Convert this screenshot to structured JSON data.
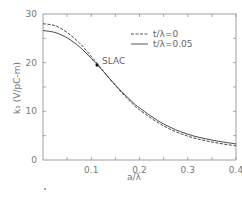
{
  "chart_data": {
    "type": "line",
    "title": "",
    "xlabel": "a/λ",
    "ylabel": "k₁ (V/pC-m)",
    "xlim": [
      0,
      0.4
    ],
    "ylim": [
      0,
      30
    ],
    "xticks": [
      0.1,
      0.2,
      0.3,
      0.4
    ],
    "xtick_labels": [
      "0.1",
      "0.2",
      "0.3",
      "0.4"
    ],
    "yticks": [
      0,
      10,
      20,
      30
    ],
    "ytick_labels": [
      "0",
      "10",
      "20",
      "30"
    ],
    "grid": false,
    "legend_position": "upper right",
    "series": [
      {
        "name": "t/λ=0",
        "style": "dashed",
        "x": [
          0.0,
          0.025,
          0.05,
          0.075,
          0.1,
          0.125,
          0.15,
          0.175,
          0.2,
          0.25,
          0.3,
          0.35,
          0.4
        ],
        "y": [
          28.0,
          27.6,
          26.2,
          24.1,
          21.3,
          18.3,
          15.3,
          12.6,
          10.3,
          7.0,
          4.9,
          3.7,
          2.9
        ]
      },
      {
        "name": "t/λ=0.05",
        "style": "solid",
        "x": [
          0.0,
          0.025,
          0.05,
          0.075,
          0.1,
          0.125,
          0.15,
          0.175,
          0.2,
          0.25,
          0.3,
          0.35,
          0.4
        ],
        "y": [
          26.6,
          26.2,
          25.1,
          23.3,
          20.9,
          18.2,
          15.4,
          12.9,
          10.7,
          7.4,
          5.3,
          4.1,
          3.3
        ]
      }
    ],
    "annotations": [
      {
        "text": "SLAC",
        "x": 0.112,
        "y": 19.5,
        "marker": "filled-circle"
      }
    ]
  }
}
